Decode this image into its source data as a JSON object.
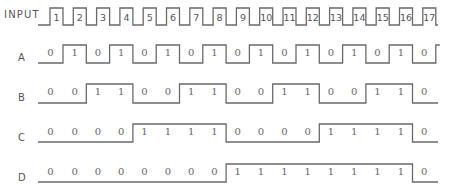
{
  "diagram": {
    "input_label": "INPUT",
    "pulse_numbers": [
      "1",
      "2",
      "3",
      "4",
      "5",
      "6",
      "7",
      "8",
      "9",
      "10",
      "11",
      "12",
      "13",
      "14",
      "15",
      "16",
      "17"
    ],
    "rows": [
      {
        "label": "A",
        "bits": [
          0,
          1,
          0,
          1,
          0,
          1,
          0,
          1,
          0,
          1,
          0,
          1,
          0,
          1,
          0,
          1,
          0
        ]
      },
      {
        "label": "B",
        "bits": [
          0,
          0,
          1,
          1,
          0,
          0,
          1,
          1,
          0,
          0,
          1,
          1,
          0,
          0,
          1,
          1,
          0
        ]
      },
      {
        "label": "C",
        "bits": [
          0,
          0,
          0,
          0,
          1,
          1,
          1,
          1,
          0,
          0,
          0,
          0,
          1,
          1,
          1,
          1,
          0
        ]
      },
      {
        "label": "D",
        "bits": [
          0,
          0,
          0,
          0,
          0,
          0,
          0,
          0,
          1,
          1,
          1,
          1,
          1,
          1,
          1,
          1,
          0
        ]
      }
    ],
    "colors": {
      "line": "#6a6a6a",
      "text": "#555555",
      "background": "#ffffff"
    }
  }
}
